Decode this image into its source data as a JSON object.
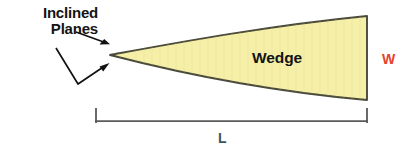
{
  "diagram": {
    "canvas": {
      "width": 413,
      "height": 158,
      "background": "#ffffff"
    },
    "labels": {
      "inclined_planes_line1": "Inclined",
      "inclined_planes_line2": "Planes",
      "wedge": "Wedge",
      "width_dimension": "W",
      "length_dimension": "L"
    },
    "colors": {
      "wedge_fill": "#F5EFA8",
      "wedge_outline": "#4a4a3a",
      "text_dark": "#141414",
      "width_label_color": "#e8402a",
      "length_label_color": "#3d5560",
      "bracket_color": "#5a5a5a",
      "arrow_color": "#111111"
    },
    "shapes": {
      "wedge": {
        "name": "wedge-body",
        "apex": [
          110,
          55
        ],
        "top_right": [
          367,
          16
        ],
        "bottom_right": [
          367,
          100
        ],
        "top_edge_curve": "convex-up",
        "bottom_edge_curve": "concave-up"
      },
      "upper_arrow": {
        "name": "upper-inclined-plane-arrow",
        "from": [
          76,
          32
        ],
        "to": [
          110,
          44
        ]
      },
      "lower_arrow": {
        "name": "lower-inclined-plane-arrow",
        "from": [
          56,
          48
        ],
        "vertex": [
          78,
          84
        ],
        "to": [
          109,
          63
        ]
      },
      "length_bracket": {
        "name": "length-dimension-bracket",
        "left_x": 96,
        "right_x": 367,
        "baseline_y": 122,
        "tick_top_y": 109
      }
    }
  }
}
